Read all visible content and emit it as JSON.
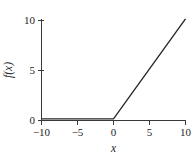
{
  "chart_data": {
    "type": "line",
    "title": "",
    "subtitle": "",
    "xlabel": "x",
    "ylabel": "f(x)",
    "xlim": [
      -10,
      10
    ],
    "ylim": [
      0,
      10
    ],
    "grid": false,
    "legend": null,
    "legend_position": "none",
    "x_ticks": [
      -10,
      -5,
      0,
      5,
      10
    ],
    "x_tick_labels": [
      "−10",
      "−5",
      "0",
      "5",
      "10"
    ],
    "y_ticks": [
      0,
      5,
      10
    ],
    "y_tick_labels": [
      "0",
      "5",
      "10"
    ],
    "series": [
      {
        "name": "f(x) = max(0, x)",
        "color": "#262626",
        "x": [
          -10,
          0,
          10
        ],
        "values": [
          0,
          0,
          10
        ]
      }
    ],
    "annotations": []
  },
  "axes": {
    "x_axis_name": "x-axis",
    "y_axis_name": "y-axis"
  },
  "colors": {
    "line": "#262626",
    "axis": "#3a3a3a",
    "text": "#252525",
    "background": "#ffffff"
  }
}
